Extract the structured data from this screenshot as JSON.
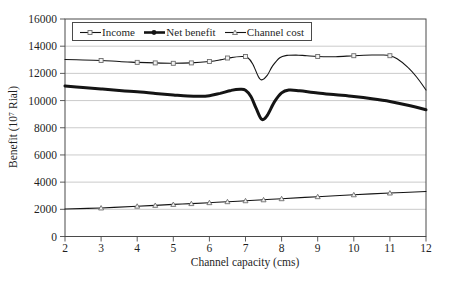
{
  "figure": {
    "background_color": "#ffffff",
    "text_color": "#1f1f1f",
    "grid_color": "#a8a8a8",
    "frame_color": "#4a4a4a",
    "series_color": "#141414",
    "marker_fill": "#f2f2f2",
    "marker_stroke": "#6e6e6e"
  },
  "legend": {
    "items": [
      {
        "label": "Income",
        "marker": "square-open",
        "line": "thin"
      },
      {
        "label": "Net benefit",
        "marker": "circle-filled",
        "line": "thick"
      },
      {
        "label": "Channel cost",
        "marker": "triangle-open",
        "line": "thin"
      }
    ]
  },
  "chart_data": {
    "type": "line",
    "title": "",
    "xlabel": "Channel capacity (cms)",
    "ylabel": "Benefit (10⁷ Rial)",
    "xlim": [
      2,
      12
    ],
    "ylim": [
      0,
      16000
    ],
    "x_ticks": [
      2,
      3,
      4,
      5,
      6,
      7,
      8,
      9,
      10,
      11,
      12
    ],
    "y_ticks": [
      0,
      2000,
      4000,
      6000,
      8000,
      10000,
      12000,
      14000,
      16000
    ],
    "grid": "horizontal",
    "legend_position": "top-left-inside",
    "categories": [
      2,
      3,
      4,
      4.5,
      5,
      5.5,
      6,
      6.5,
      7,
      7.5,
      8,
      9,
      10,
      11,
      12
    ],
    "series": [
      {
        "name": "Income",
        "line_width": 1.1,
        "marker": "square-open",
        "values": [
          13020,
          12950,
          12810,
          12770,
          12740,
          12770,
          12870,
          13130,
          13240,
          11520,
          13300,
          13240,
          13300,
          13300,
          10780
        ],
        "markers": [
          [
            3,
            12950
          ],
          [
            4,
            12810
          ],
          [
            4.5,
            12770
          ],
          [
            5,
            12740
          ],
          [
            5.5,
            12770
          ],
          [
            6,
            12870
          ],
          [
            6.5,
            13130
          ],
          [
            7,
            13240
          ],
          [
            9,
            13240
          ],
          [
            10,
            13300
          ],
          [
            11,
            13300
          ]
        ],
        "curve": [
          [
            2,
            13020
          ],
          [
            2.5,
            12985
          ],
          [
            3,
            12950
          ],
          [
            3.5,
            12870
          ],
          [
            4,
            12810
          ],
          [
            4.5,
            12770
          ],
          [
            5,
            12740
          ],
          [
            5.5,
            12770
          ],
          [
            6,
            12870
          ],
          [
            6.3,
            12990
          ],
          [
            6.6,
            13160
          ],
          [
            6.9,
            13240
          ],
          [
            7.05,
            13180
          ],
          [
            7.2,
            12700
          ],
          [
            7.35,
            11800
          ],
          [
            7.45,
            11520
          ],
          [
            7.6,
            11850
          ],
          [
            7.75,
            12550
          ],
          [
            7.95,
            13150
          ],
          [
            8.15,
            13320
          ],
          [
            8.4,
            13350
          ],
          [
            8.7,
            13300
          ],
          [
            9,
            13240
          ],
          [
            9.5,
            13230
          ],
          [
            10,
            13300
          ],
          [
            10.5,
            13350
          ],
          [
            10.8,
            13350
          ],
          [
            11,
            13300
          ],
          [
            11.2,
            13080
          ],
          [
            11.5,
            12450
          ],
          [
            11.75,
            11700
          ],
          [
            12,
            10780
          ]
        ]
      },
      {
        "name": "Net benefit",
        "line_width": 3,
        "marker": "circle-filled",
        "values": [
          11070,
          10850,
          10650,
          10530,
          10420,
          10330,
          10360,
          10750,
          10840,
          8620,
          10560,
          10560,
          10300,
          9940,
          9320
        ],
        "markers": [],
        "curve": [
          [
            2,
            11070
          ],
          [
            2.5,
            10960
          ],
          [
            3,
            10850
          ],
          [
            3.5,
            10750
          ],
          [
            4,
            10650
          ],
          [
            4.5,
            10530
          ],
          [
            5,
            10420
          ],
          [
            5.4,
            10340
          ],
          [
            5.75,
            10310
          ],
          [
            6,
            10360
          ],
          [
            6.3,
            10530
          ],
          [
            6.6,
            10750
          ],
          [
            6.85,
            10830
          ],
          [
            7,
            10760
          ],
          [
            7.15,
            10300
          ],
          [
            7.3,
            9400
          ],
          [
            7.45,
            8620
          ],
          [
            7.6,
            8900
          ],
          [
            7.8,
            9900
          ],
          [
            8,
            10560
          ],
          [
            8.2,
            10770
          ],
          [
            8.5,
            10720
          ],
          [
            9,
            10560
          ],
          [
            9.5,
            10430
          ],
          [
            10,
            10300
          ],
          [
            10.5,
            10140
          ],
          [
            11,
            9940
          ],
          [
            11.5,
            9660
          ],
          [
            12,
            9320
          ]
        ]
      },
      {
        "name": "Channel cost",
        "line_width": 1.1,
        "marker": "triangle-open",
        "values": [
          2020,
          2100,
          2230,
          2290,
          2360,
          2420,
          2490,
          2560,
          2630,
          2700,
          2780,
          2930,
          3070,
          3200,
          3310
        ],
        "markers": [
          [
            3,
            2100
          ],
          [
            4,
            2230
          ],
          [
            4.5,
            2290
          ],
          [
            5,
            2360
          ],
          [
            5.5,
            2420
          ],
          [
            6,
            2490
          ],
          [
            6.5,
            2560
          ],
          [
            7,
            2630
          ],
          [
            7.5,
            2700
          ],
          [
            8,
            2780
          ],
          [
            9,
            2930
          ],
          [
            10,
            3070
          ],
          [
            11,
            3200
          ]
        ],
        "curve": [
          [
            2,
            2020
          ],
          [
            3,
            2100
          ],
          [
            4,
            2230
          ],
          [
            4.5,
            2290
          ],
          [
            5,
            2360
          ],
          [
            5.5,
            2420
          ],
          [
            6,
            2490
          ],
          [
            6.5,
            2560
          ],
          [
            7,
            2630
          ],
          [
            7.5,
            2700
          ],
          [
            8,
            2780
          ],
          [
            9,
            2930
          ],
          [
            10,
            3070
          ],
          [
            11,
            3200
          ],
          [
            12,
            3310
          ]
        ]
      }
    ]
  }
}
